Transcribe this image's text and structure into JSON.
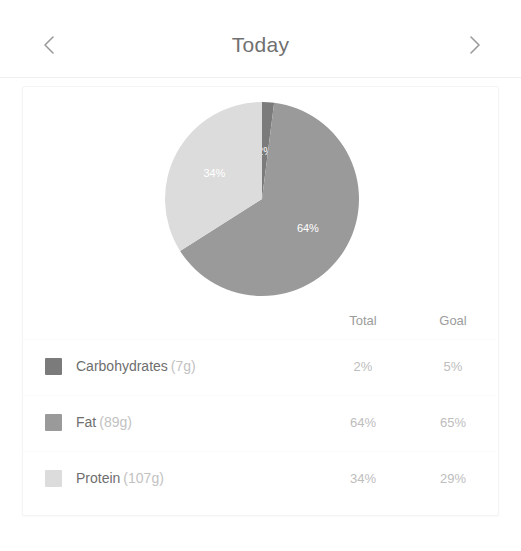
{
  "header": {
    "title": "Today",
    "prev_icon": "chevron-left-icon",
    "next_icon": "chevron-right-icon"
  },
  "table": {
    "columns": [
      "Total",
      "Goal"
    ],
    "rows": [
      {
        "name": "Carbohydrates",
        "grams": "(7g)",
        "total": "2%",
        "goal": "5%",
        "color": "#7b7b7b"
      },
      {
        "name": "Fat",
        "grams": "(89g)",
        "total": "64%",
        "goal": "65%",
        "color": "#9a9a9a"
      },
      {
        "name": "Protein",
        "grams": "(107g)",
        "total": "34%",
        "goal": "29%",
        "color": "#dcdcdc"
      }
    ]
  },
  "chart_data": {
    "type": "pie",
    "title": "",
    "categories": [
      "Carbohydrates",
      "Fat",
      "Protein"
    ],
    "values": [
      2,
      64,
      34
    ],
    "unit": "%",
    "labels": [
      "2%",
      "64%",
      "34%"
    ],
    "colors": [
      "#7b7b7b",
      "#9a9a9a",
      "#dcdcdc"
    ],
    "grams": [
      7,
      89,
      107
    ],
    "goals": [
      5,
      65,
      29
    ],
    "start_angle_deg": 0,
    "direction": "clockwise",
    "legend_position": "bottom",
    "grid": false
  }
}
